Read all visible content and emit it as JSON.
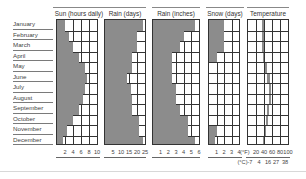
{
  "chart_data": [
    {
      "type": "bar",
      "orientation": "horizontal",
      "title": "Sun (hours daily)",
      "categories": [
        "January",
        "February",
        "March",
        "April",
        "May",
        "June",
        "July",
        "August",
        "September",
        "October",
        "November",
        "December"
      ],
      "values": [
        2,
        3,
        4,
        5.5,
        7,
        7.5,
        7,
        6.5,
        5.5,
        4,
        2.5,
        1.5
      ],
      "xlim": [
        0,
        10
      ],
      "ticks": [
        "2",
        "4",
        "6",
        "8",
        "10"
      ]
    },
    {
      "type": "bar",
      "orientation": "horizontal",
      "title": "Rain (days)",
      "categories": [
        "January",
        "February",
        "March",
        "April",
        "May",
        "June",
        "July",
        "August",
        "September",
        "October",
        "November",
        "December"
      ],
      "values": [
        24,
        20,
        20,
        17,
        17,
        14,
        16,
        17,
        17,
        21,
        21,
        24
      ],
      "xlim": [
        0,
        25
      ],
      "ticks": [
        "5",
        "10",
        "15",
        "20",
        "25"
      ]
    },
    {
      "type": "bar",
      "orientation": "horizontal",
      "title": "Rain (inches)",
      "categories": [
        "January",
        "February",
        "March",
        "April",
        "May",
        "June",
        "July",
        "August",
        "September",
        "October",
        "November",
        "December"
      ],
      "values": [
        5.5,
        4,
        3.5,
        2.5,
        2.5,
        2.5,
        3,
        3,
        3.5,
        4.5,
        4.5,
        5.5
      ],
      "xlim": [
        0,
        6
      ],
      "ticks": [
        "1",
        "2",
        "3",
        "4",
        "5",
        "6"
      ]
    },
    {
      "type": "bar",
      "orientation": "horizontal",
      "title": "Snow (days)",
      "categories": [
        "January",
        "February",
        "March",
        "April",
        "May",
        "June",
        "July",
        "August",
        "September",
        "October",
        "November",
        "December"
      ],
      "values": [
        2,
        2,
        2,
        1,
        0,
        0,
        0,
        0,
        0,
        0,
        1,
        0.8
      ],
      "xlim": [
        0,
        4
      ],
      "ticks": [
        "1",
        "2",
        "3",
        "4"
      ]
    },
    {
      "type": "area",
      "orientation": "horizontal-range",
      "title": "Temperature",
      "categories": [
        "January",
        "February",
        "March",
        "April",
        "May",
        "June",
        "July",
        "August",
        "September",
        "October",
        "November",
        "December"
      ],
      "series": [
        {
          "name": "low (°F)",
          "values": [
            34,
            35,
            36,
            38,
            42,
            48,
            52,
            52,
            48,
            44,
            40,
            38
          ]
        },
        {
          "name": "high (°F)",
          "values": [
            40,
            40,
            41,
            43,
            48,
            54,
            58,
            57,
            53,
            49,
            45,
            43
          ]
        }
      ],
      "xlim": [
        0,
        100
      ],
      "ticks_f": [
        "(°F)",
        "20",
        "40",
        "60",
        "80",
        "100"
      ],
      "ticks_c": [
        "(°C)-7",
        "4",
        "16",
        "27",
        "38"
      ]
    }
  ],
  "months": [
    "January",
    "February",
    "March",
    "April",
    "May",
    "June",
    "July",
    "August",
    "September",
    "October",
    "November",
    "December"
  ],
  "colors": {
    "bar": "#8c8c8c",
    "grid": "#333333"
  }
}
